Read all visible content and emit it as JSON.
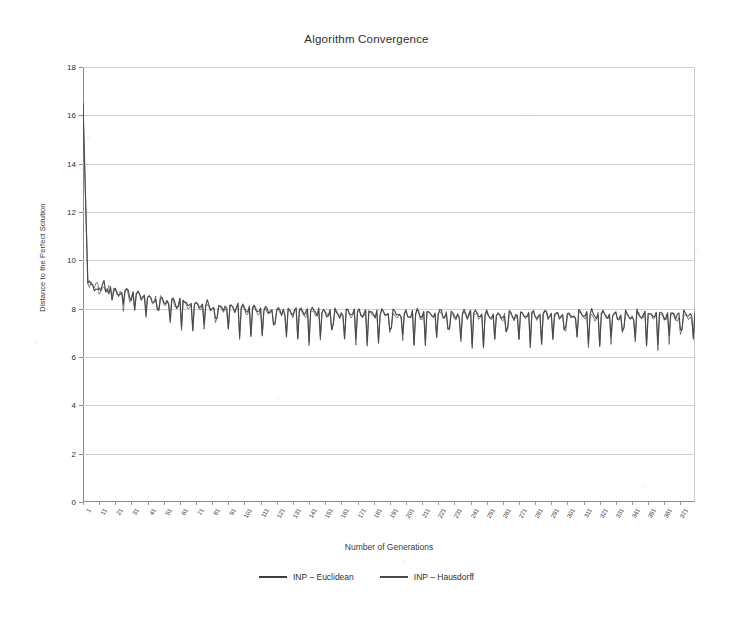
{
  "chart_data": {
    "type": "line",
    "title": "Algorithm Convergence",
    "xlabel": "Number of Generations",
    "ylabel": "Distance to the Perfect Solution",
    "grid": true,
    "legend_position": "bottom-center",
    "xlim": [
      1,
      380
    ],
    "ylim": [
      0,
      18
    ],
    "yticks": [
      0,
      2,
      4,
      6,
      8,
      10,
      12,
      14,
      16,
      18
    ],
    "ytick_labels": [
      "0",
      "2",
      "4",
      "6",
      "8",
      "10",
      "12",
      "14",
      "16",
      "18"
    ],
    "xticks": [
      1,
      11,
      21,
      31,
      41,
      51,
      61,
      71,
      81,
      91,
      101,
      111,
      121,
      131,
      141,
      151,
      161,
      171,
      181,
      191,
      201,
      211,
      221,
      231,
      241,
      251,
      261,
      271,
      281,
      291,
      301,
      311,
      321,
      331,
      341,
      351,
      361,
      371
    ],
    "xtick_labels": [
      "1",
      "11",
      "21",
      "31",
      "41",
      "51",
      "61",
      "71",
      "81",
      "91",
      "101",
      "111",
      "121",
      "131",
      "141",
      "151",
      "161",
      "171",
      "181",
      "191",
      "201",
      "211",
      "221",
      "231",
      "241",
      "251",
      "261",
      "271",
      "281",
      "291",
      "301",
      "311",
      "321",
      "331",
      "341",
      "351",
      "361",
      "371"
    ],
    "series": [
      {
        "name": "INP – Euclidean",
        "color": "#3c3c3c",
        "start_value": 16.5,
        "plateau_value": 7.75,
        "sawtooth_min": 6.45,
        "description": "Starts at 16.5, drops sharply to ~9.0 by generation 5, settles into a decaying sawtooth that plateaus near 7.75 with periodic dips to ~6.5"
      },
      {
        "name": "INP – Hausdorff",
        "color": "#4a4a4a",
        "start_value": 16.4,
        "plateau_value": 7.7,
        "sawtooth_min": 6.4,
        "description": "Nearly coincident with the Euclidean series; same sharp initial descent and sawtooth plateau slightly below it"
      }
    ],
    "annotations": []
  },
  "legend": {
    "items": [
      {
        "label": "INP – Euclidean",
        "color": "#3c3c3c",
        "swatch_name": "legend-swatch-euclidean"
      },
      {
        "label": "INP – Hausdorff",
        "color": "#4a4a4a",
        "swatch_name": "legend-swatch-hausdorff"
      }
    ]
  }
}
